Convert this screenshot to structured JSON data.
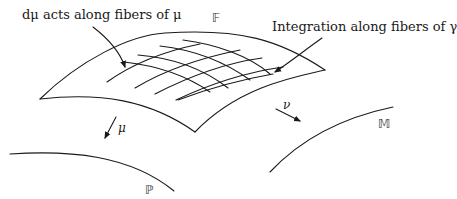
{
  "diagram": {
    "annotations": {
      "left_callout": "dμ acts along fibers of μ",
      "right_callout": "Integration along fibers of γ"
    },
    "spaces": {
      "total": "𝔽",
      "left_base": "ℙ",
      "right_base": "𝕄"
    },
    "maps": {
      "left": "μ",
      "right": "ν"
    },
    "stroke_color": "#1a1a1a",
    "background": "#ffffff"
  }
}
